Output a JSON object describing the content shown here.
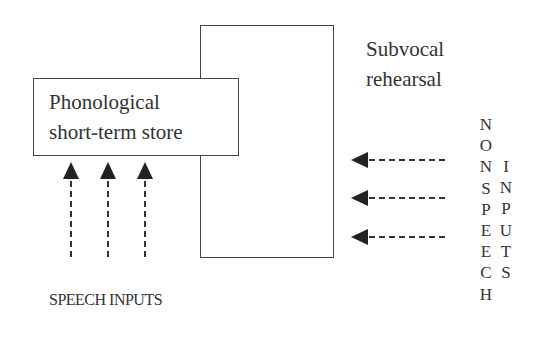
{
  "diagram": {
    "type": "phonological-loop-model",
    "boxes": {
      "rehearsal_box": {
        "label": ""
      },
      "store_box": {
        "label_lines": [
          "Phonological",
          "short-term store"
        ]
      }
    },
    "labels": {
      "rehearsal": [
        "Subvocal",
        "rehearsal"
      ],
      "speech_inputs": "SPEECH INPUTS",
      "nonspeech_inputs_col1": [
        "N",
        "O",
        "N",
        "S",
        "P",
        "E",
        "E",
        "C",
        "H"
      ],
      "nonspeech_inputs_col2": [
        "I",
        "N",
        "P",
        "U",
        "T",
        "S"
      ]
    },
    "arrows": {
      "speech_inputs_count": 3,
      "speech_inputs_direction": "up",
      "nonspeech_inputs_count": 3,
      "nonspeech_inputs_direction": "left",
      "style": "dashed"
    },
    "colors": {
      "line": "#444444",
      "text": "#333333",
      "background": "#ffffff"
    }
  }
}
